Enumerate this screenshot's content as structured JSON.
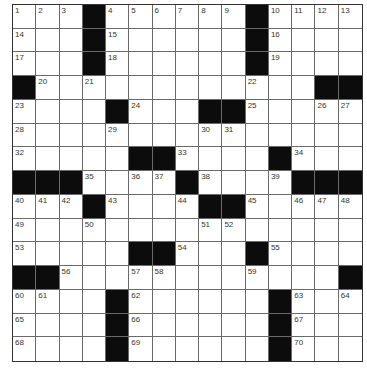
{
  "puzzle": {
    "rows": 15,
    "cols": 15,
    "colors": {
      "block": "#0c0c0c",
      "cell": "#ffffff",
      "line": "#6a6a6a",
      "number": "#333333"
    },
    "grid": [
      "...#......#....",
      "...#......#....",
      "...#......#....",
      "#............##",
      "....#...##.....",
      "...............",
      ".....##....#...",
      "###....#....###",
      "...#....##.....",
      "...............",
      ".....##...#....",
      "##............#",
      "....#......#...",
      "....#......#...",
      "....#......#..."
    ],
    "numbers": [
      {
        "r": 0,
        "c": 0,
        "n": "1"
      },
      {
        "r": 0,
        "c": 1,
        "n": "2"
      },
      {
        "r": 0,
        "c": 2,
        "n": "3"
      },
      {
        "r": 0,
        "c": 4,
        "n": "4"
      },
      {
        "r": 0,
        "c": 5,
        "n": "5"
      },
      {
        "r": 0,
        "c": 6,
        "n": "6"
      },
      {
        "r": 0,
        "c": 7,
        "n": "7"
      },
      {
        "r": 0,
        "c": 8,
        "n": "8"
      },
      {
        "r": 0,
        "c": 9,
        "n": "9"
      },
      {
        "r": 0,
        "c": 11,
        "n": "10"
      },
      {
        "r": 0,
        "c": 12,
        "n": "11"
      },
      {
        "r": 0,
        "c": 13,
        "n": "12"
      },
      {
        "r": 0,
        "c": 14,
        "n": "13"
      },
      {
        "r": 1,
        "c": 0,
        "n": "14"
      },
      {
        "r": 1,
        "c": 4,
        "n": "15"
      },
      {
        "r": 1,
        "c": 11,
        "n": "16"
      },
      {
        "r": 2,
        "c": 0,
        "n": "17"
      },
      {
        "r": 2,
        "c": 4,
        "n": "18"
      },
      {
        "r": 2,
        "c": 11,
        "n": "19"
      },
      {
        "r": 3,
        "c": 1,
        "n": "20"
      },
      {
        "r": 3,
        "c": 3,
        "n": "21"
      },
      {
        "r": 3,
        "c": 10,
        "n": "22"
      },
      {
        "r": 4,
        "c": 0,
        "n": "23"
      },
      {
        "r": 4,
        "c": 5,
        "n": "24"
      },
      {
        "r": 4,
        "c": 10,
        "n": "25"
      },
      {
        "r": 4,
        "c": 13,
        "n": "26"
      },
      {
        "r": 4,
        "c": 14,
        "n": "27"
      },
      {
        "r": 5,
        "c": 0,
        "n": "28"
      },
      {
        "r": 5,
        "c": 4,
        "n": "29"
      },
      {
        "r": 5,
        "c": 8,
        "n": "30"
      },
      {
        "r": 5,
        "c": 9,
        "n": "31"
      },
      {
        "r": 6,
        "c": 0,
        "n": "32"
      },
      {
        "r": 6,
        "c": 7,
        "n": "33"
      },
      {
        "r": 6,
        "c": 12,
        "n": "34"
      },
      {
        "r": 7,
        "c": 3,
        "n": "35"
      },
      {
        "r": 7,
        "c": 5,
        "n": "36"
      },
      {
        "r": 7,
        "c": 6,
        "n": "37"
      },
      {
        "r": 7,
        "c": 8,
        "n": "38"
      },
      {
        "r": 7,
        "c": 11,
        "n": "39"
      },
      {
        "r": 8,
        "c": 0,
        "n": "40"
      },
      {
        "r": 8,
        "c": 1,
        "n": "41"
      },
      {
        "r": 8,
        "c": 2,
        "n": "42"
      },
      {
        "r": 8,
        "c": 4,
        "n": "43"
      },
      {
        "r": 8,
        "c": 7,
        "n": "44"
      },
      {
        "r": 8,
        "c": 10,
        "n": "45"
      },
      {
        "r": 8,
        "c": 12,
        "n": "46"
      },
      {
        "r": 8,
        "c": 13,
        "n": "47"
      },
      {
        "r": 8,
        "c": 14,
        "n": "48"
      },
      {
        "r": 9,
        "c": 0,
        "n": "49"
      },
      {
        "r": 9,
        "c": 3,
        "n": "50"
      },
      {
        "r": 9,
        "c": 8,
        "n": "51"
      },
      {
        "r": 9,
        "c": 9,
        "n": "52"
      },
      {
        "r": 10,
        "c": 0,
        "n": "53"
      },
      {
        "r": 10,
        "c": 7,
        "n": "54"
      },
      {
        "r": 10,
        "c": 11,
        "n": "55"
      },
      {
        "r": 11,
        "c": 2,
        "n": "56"
      },
      {
        "r": 11,
        "c": 5,
        "n": "57"
      },
      {
        "r": 11,
        "c": 6,
        "n": "58"
      },
      {
        "r": 11,
        "c": 10,
        "n": "59"
      },
      {
        "r": 12,
        "c": 0,
        "n": "60"
      },
      {
        "r": 12,
        "c": 1,
        "n": "61"
      },
      {
        "r": 12,
        "c": 5,
        "n": "62"
      },
      {
        "r": 12,
        "c": 12,
        "n": "63"
      },
      {
        "r": 12,
        "c": 14,
        "n": "64"
      },
      {
        "r": 13,
        "c": 0,
        "n": "65"
      },
      {
        "r": 13,
        "c": 5,
        "n": "66"
      },
      {
        "r": 13,
        "c": 12,
        "n": "67"
      },
      {
        "r": 14,
        "c": 0,
        "n": "68"
      },
      {
        "r": 14,
        "c": 5,
        "n": "69"
      },
      {
        "r": 14,
        "c": 12,
        "n": "70"
      }
    ]
  }
}
